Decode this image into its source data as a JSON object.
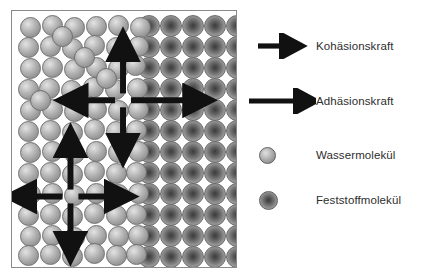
{
  "figure": {
    "title_visible": false,
    "background_color": "#ffffff"
  },
  "container": {
    "name": "molecule-container",
    "border_color": "#8a8a8a",
    "fill_color": "#ffffff",
    "regions": [
      {
        "id": "water-region",
        "label": "Wassermolekül region",
        "side": "left"
      },
      {
        "id": "solid-region",
        "label": "Feststoffmolekül region",
        "side": "right"
      }
    ]
  },
  "molecules": {
    "water_color": "#b4b4b4",
    "solid_color": "#6f6f6f",
    "water_count": 74,
    "solid_count": 60,
    "water_positions": [
      [
        8,
        6
      ],
      [
        30,
        4
      ],
      [
        52,
        6
      ],
      [
        74,
        5
      ],
      [
        96,
        4
      ],
      [
        118,
        6
      ],
      [
        6,
        26
      ],
      [
        28,
        25
      ],
      [
        50,
        27
      ],
      [
        72,
        24
      ],
      [
        94,
        26
      ],
      [
        116,
        25
      ],
      [
        8,
        47
      ],
      [
        30,
        46
      ],
      [
        52,
        48
      ],
      [
        74,
        46
      ],
      [
        96,
        47
      ],
      [
        113,
        44
      ],
      [
        6,
        68
      ],
      [
        27,
        67
      ],
      [
        49,
        69
      ],
      [
        71,
        66
      ],
      [
        93,
        68
      ],
      [
        115,
        67
      ],
      [
        8,
        89
      ],
      [
        30,
        88
      ],
      [
        52,
        90
      ],
      [
        74,
        88
      ],
      [
        96,
        89
      ],
      [
        116,
        88
      ],
      [
        6,
        110
      ],
      [
        28,
        109
      ],
      [
        50,
        111
      ],
      [
        72,
        108
      ],
      [
        94,
        110
      ],
      [
        114,
        109
      ],
      [
        8,
        131
      ],
      [
        30,
        130
      ],
      [
        52,
        132
      ],
      [
        74,
        130
      ],
      [
        96,
        131
      ],
      [
        116,
        130
      ],
      [
        6,
        152
      ],
      [
        28,
        151
      ],
      [
        50,
        153
      ],
      [
        72,
        150
      ],
      [
        94,
        152
      ],
      [
        114,
        151
      ],
      [
        8,
        173
      ],
      [
        30,
        172
      ],
      [
        52,
        174
      ],
      [
        74,
        172
      ],
      [
        96,
        173
      ],
      [
        116,
        172
      ],
      [
        6,
        194
      ],
      [
        28,
        193
      ],
      [
        50,
        195
      ],
      [
        72,
        192
      ],
      [
        94,
        194
      ],
      [
        114,
        193
      ],
      [
        8,
        215
      ],
      [
        30,
        214
      ],
      [
        52,
        216
      ],
      [
        74,
        214
      ],
      [
        96,
        215
      ],
      [
        116,
        214
      ],
      [
        6,
        234
      ],
      [
        28,
        233
      ],
      [
        50,
        235
      ],
      [
        72,
        232
      ],
      [
        94,
        234
      ],
      [
        114,
        233
      ],
      [
        40,
        15
      ],
      [
        62,
        36
      ],
      [
        84,
        57
      ],
      [
        18,
        79
      ]
    ],
    "solid_grid": {
      "start_x": 126,
      "start_y": 4,
      "cols": 5,
      "rows": 12,
      "spacing_x": 22,
      "spacing_y": 21,
      "stagger_x": 0
    }
  },
  "arrows": {
    "color": "#111111",
    "diagram_arrows": [
      {
        "id": "upper-cross-up",
        "label": "Kohäsionskraft up",
        "type": "cohesion",
        "x1": 112,
        "y1": 83,
        "x2": 112,
        "y2": 38
      },
      {
        "id": "upper-cross-down",
        "label": "Kohäsionskraft down",
        "type": "cohesion",
        "x1": 112,
        "y1": 97,
        "x2": 112,
        "y2": 136
      },
      {
        "id": "upper-cross-left",
        "label": "Kohäsionskraft left",
        "type": "cohesion",
        "x1": 104,
        "y1": 90,
        "x2": 64,
        "y2": 90
      },
      {
        "id": "upper-cross-right",
        "label": "Adhäsionskraft right",
        "type": "adhesion",
        "x1": 120,
        "y1": 90,
        "x2": 185,
        "y2": 90
      },
      {
        "id": "lower-cross-up",
        "label": "Kohäsionskraft up",
        "type": "cohesion",
        "x1": 59,
        "y1": 180,
        "x2": 59,
        "y2": 135
      },
      {
        "id": "lower-cross-down",
        "label": "Kohäsionskraft down",
        "type": "cohesion",
        "x1": 59,
        "y1": 194,
        "x2": 59,
        "y2": 235
      },
      {
        "id": "lower-cross-left",
        "label": "Kohäsionskraft left",
        "type": "cohesion",
        "x1": 51,
        "y1": 187,
        "x2": 12,
        "y2": 187
      },
      {
        "id": "lower-cross-right",
        "label": "Kohäsionskraft right",
        "type": "cohesion",
        "x1": 67,
        "y1": 187,
        "x2": 106,
        "y2": 187
      }
    ]
  },
  "legend": {
    "items": [
      {
        "id": "kohaesionskraft",
        "symbol": "arrow-short",
        "label": "Kohäsionskraft",
        "top": 33,
        "arrow_x1": 10,
        "arrow_x2": 47
      },
      {
        "id": "adhaesionskraft",
        "symbol": "arrow-long",
        "label": "Adhäsionskraft",
        "top": 88,
        "arrow_x1": 1,
        "arrow_x2": 62
      },
      {
        "id": "wassermolekuel",
        "symbol": "circle-water",
        "label": "Wassermolekül",
        "top": 142
      },
      {
        "id": "feststoffmolekuel",
        "symbol": "circle-solid",
        "label": "Feststoffmolekül",
        "top": 187
      }
    ]
  }
}
